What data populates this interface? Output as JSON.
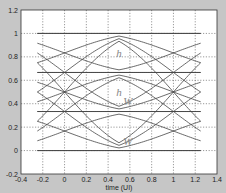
{
  "chart_data": {
    "type": "line",
    "subtype": "eye-diagram (4-level / PAM4)",
    "title": "",
    "xlabel": "time (UI)",
    "ylabel": "",
    "xlim": [
      -0.4,
      1.4
    ],
    "ylim": [
      -0.2,
      1.2
    ],
    "xticks": [
      -0.4,
      -0.2,
      0,
      0.2,
      0.4,
      0.6,
      0.8,
      1,
      1.2,
      1.4
    ],
    "xtick_labels": [
      "-0.4",
      "-0.2",
      "0",
      "0.2",
      "0.4",
      "0.6",
      "0.8",
      "1",
      "1.2",
      "1.4"
    ],
    "yticks": [
      -0.2,
      0,
      0.2,
      0.4,
      0.6,
      0.8,
      1,
      1.2
    ],
    "ytick_labels": [
      "-0.2",
      "0",
      "0.2",
      "0.4",
      "0.6",
      "0.8",
      "1",
      "1.2"
    ],
    "grid": true,
    "levels": [
      0,
      0.3333,
      0.6667,
      1
    ],
    "trace_x_range": [
      -0.25,
      1.25
    ],
    "eye_center_x": 0.5,
    "annotations": [
      {
        "text": "h",
        "x": 0.5,
        "y": 0.83
      },
      {
        "text": "h",
        "x": 0.5,
        "y": 0.5
      },
      {
        "text": "W",
        "x": 0.58,
        "y": 0.42
      },
      {
        "text": "W",
        "x": 0.58,
        "y": 0.08
      }
    ],
    "legend": null
  },
  "figure": {
    "background": "#c6c6c6",
    "axes_background": "#ffffff",
    "trace_color": "#444444",
    "grid_color": "#555555",
    "annotation_color": "#888888"
  }
}
